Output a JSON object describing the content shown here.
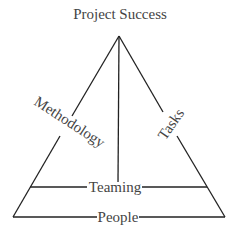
{
  "title": "Project Success",
  "labels": {
    "left_side": "Methodology",
    "right_side": "Tasks",
    "middle_band": "Teaming",
    "base": "People"
  },
  "colors": {
    "line": "#222222",
    "text": "#444444"
  }
}
